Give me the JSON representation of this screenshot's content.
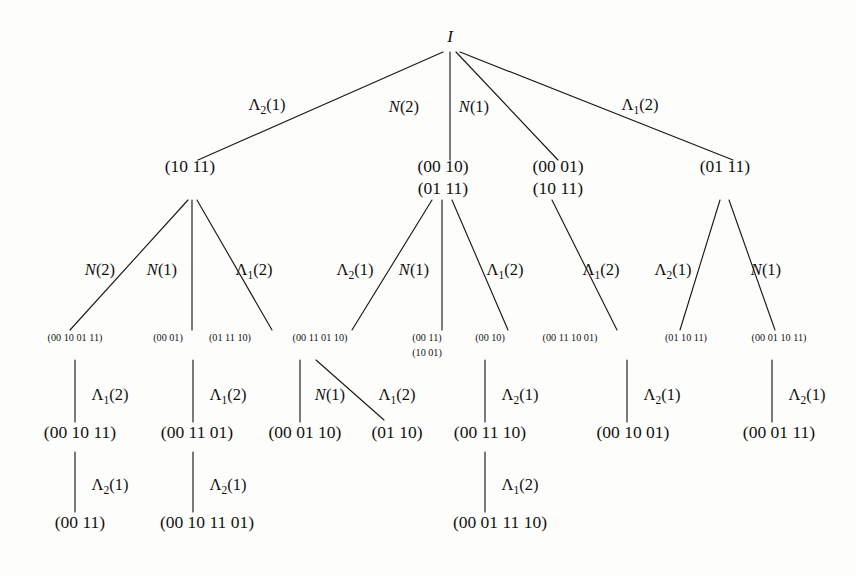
{
  "figure": {
    "type": "derivation-tree",
    "background_color": "#fdfdfc",
    "line_color": "#1a1a1a",
    "text_color": "#111111"
  },
  "nodes": [
    {
      "id": "n0",
      "label": "I",
      "lines": [
        "I"
      ],
      "x": 450,
      "y": 42,
      "size": "root",
      "level": 0
    },
    {
      "id": "n1",
      "label": "(10 11)",
      "lines": [
        "(10 11)"
      ],
      "x": 190,
      "y": 172,
      "size": "big",
      "level": 1
    },
    {
      "id": "n2",
      "label": "(00 10) (01 11)",
      "lines": [
        "(00 10)",
        "(01 11)"
      ],
      "x": 443,
      "y": 172,
      "size": "big",
      "level": 1
    },
    {
      "id": "n3",
      "label": "(00 01) (10 11)",
      "lines": [
        "(00 01)",
        "(10 11)"
      ],
      "x": 558,
      "y": 172,
      "size": "big",
      "level": 1
    },
    {
      "id": "n4",
      "label": "(01 11)",
      "lines": [
        "(01 11)"
      ],
      "x": 725,
      "y": 172,
      "size": "big",
      "level": 1
    },
    {
      "id": "n5",
      "label": "(00 10 01 11)",
      "lines": [
        "(00 10 01 11)"
      ],
      "x": 75,
      "y": 341,
      "size": "small",
      "level": 2
    },
    {
      "id": "n6",
      "label": "(00 01)",
      "lines": [
        "(00 01)"
      ],
      "x": 168,
      "y": 341,
      "size": "small",
      "level": 2
    },
    {
      "id": "n7",
      "label": "(01 11 10)",
      "lines": [
        "(01 11 10)"
      ],
      "x": 230,
      "y": 341,
      "size": "small",
      "level": 2
    },
    {
      "id": "n8",
      "label": "(00 11 01 10)",
      "lines": [
        "(00 11 01 10)"
      ],
      "x": 320,
      "y": 341,
      "size": "small",
      "level": 2
    },
    {
      "id": "n9",
      "label": "(00 11) (10 01)",
      "lines": [
        "(00 11)",
        "(10 01)"
      ],
      "x": 427,
      "y": 341,
      "size": "small",
      "level": 2
    },
    {
      "id": "n10",
      "label": "(00 10)",
      "lines": [
        "(00 10)"
      ],
      "x": 490,
      "y": 341,
      "size": "small",
      "level": 2
    },
    {
      "id": "n11",
      "label": "(00 11 10 01)",
      "lines": [
        "(00 11 10 01)"
      ],
      "x": 570,
      "y": 341,
      "size": "small",
      "level": 2
    },
    {
      "id": "n12",
      "label": "(01 10 11)",
      "lines": [
        "(01 10 11)"
      ],
      "x": 686,
      "y": 341,
      "size": "small",
      "level": 2
    },
    {
      "id": "n13",
      "label": "(00 01 10 11)",
      "lines": [
        "(00 01 10 11)"
      ],
      "x": 779,
      "y": 341,
      "size": "small",
      "level": 2
    },
    {
      "id": "n14",
      "label": "(00 10 11)",
      "lines": [
        "(00 10 11)"
      ],
      "x": 80,
      "y": 438,
      "size": "big",
      "level": 3
    },
    {
      "id": "n15",
      "label": "(00 11 01)",
      "lines": [
        "(00 11 01)"
      ],
      "x": 197,
      "y": 438,
      "size": "big",
      "level": 3
    },
    {
      "id": "n16",
      "label": "(00 01 10)",
      "lines": [
        "(00 01 10)"
      ],
      "x": 305,
      "y": 438,
      "size": "big",
      "level": 3
    },
    {
      "id": "n17",
      "label": "(01 10)",
      "lines": [
        "(01 10)"
      ],
      "x": 397,
      "y": 438,
      "size": "big",
      "level": 3
    },
    {
      "id": "n18",
      "label": "(00 11 10)",
      "lines": [
        "(00 11 10)"
      ],
      "x": 490,
      "y": 438,
      "size": "big",
      "level": 3
    },
    {
      "id": "n19",
      "label": "(00 10 01)",
      "lines": [
        "(00 10 01)"
      ],
      "x": 633,
      "y": 438,
      "size": "big",
      "level": 3
    },
    {
      "id": "n20",
      "label": "(00 01 11)",
      "lines": [
        "(00 01 11)"
      ],
      "x": 779,
      "y": 438,
      "size": "big",
      "level": 3
    },
    {
      "id": "n21",
      "label": "(00 11)",
      "lines": [
        "(00 11)"
      ],
      "x": 80,
      "y": 528,
      "size": "big",
      "level": 4
    },
    {
      "id": "n22",
      "label": "(00 10 11 01)",
      "lines": [
        "(00 10 11 01)"
      ],
      "x": 207,
      "y": 528,
      "size": "big",
      "level": 4
    },
    {
      "id": "n23",
      "label": "(00 01 11 10)",
      "lines": [
        "(00 01 11 10)"
      ],
      "x": 500,
      "y": 528,
      "size": "big",
      "level": 4
    }
  ],
  "edges": [
    {
      "id": "e1",
      "from": "n0",
      "to": "n1",
      "x1": 443,
      "y1": 52,
      "x2": 198,
      "y2": 160,
      "label": "Λ2(1)",
      "op": "Λ",
      "sub": "2",
      "arg": "(1)",
      "lx": 267,
      "ly": 110,
      "size": "normal"
    },
    {
      "id": "e2",
      "from": "n0",
      "to": "n2",
      "x1": 450,
      "y1": 52,
      "x2": 450,
      "y2": 160,
      "label": "N(2)",
      "op": "N",
      "sub": "",
      "arg": "(2)",
      "lx": 404,
      "ly": 112,
      "size": "normal"
    },
    {
      "id": "e3",
      "from": "n0",
      "to": "n3",
      "x1": 456,
      "y1": 52,
      "x2": 558,
      "y2": 160,
      "label": "N(1)",
      "op": "N",
      "sub": "",
      "arg": "(1)",
      "lx": 474,
      "ly": 112,
      "size": "normal"
    },
    {
      "id": "e4",
      "from": "n0",
      "to": "n4",
      "x1": 460,
      "y1": 52,
      "x2": 733,
      "y2": 160,
      "label": "Λ1(2)",
      "op": "Λ",
      "sub": "1",
      "arg": "(2)",
      "lx": 640,
      "ly": 110,
      "size": "normal"
    },
    {
      "id": "e5",
      "from": "n1",
      "to": "n5",
      "x1": 188,
      "y1": 200,
      "x2": 70,
      "y2": 330,
      "label": "N(2)",
      "op": "N",
      "sub": "",
      "arg": "(2)",
      "lx": 100,
      "ly": 275,
      "size": "normal"
    },
    {
      "id": "e6",
      "from": "n1",
      "to": "n6",
      "x1": 192,
      "y1": 200,
      "x2": 192,
      "y2": 330,
      "label": "N(1)",
      "op": "N",
      "sub": "",
      "arg": "(1)",
      "lx": 162,
      "ly": 275,
      "size": "normal"
    },
    {
      "id": "e7",
      "from": "n1",
      "to": "n7",
      "x1": 197,
      "y1": 200,
      "x2": 272,
      "y2": 330,
      "label": "Λ1(2)",
      "op": "Λ",
      "sub": "1",
      "arg": "(2)",
      "lx": 254,
      "ly": 275,
      "size": "normal"
    },
    {
      "id": "e8",
      "from": "n2",
      "to": "n8",
      "x1": 432,
      "y1": 200,
      "x2": 352,
      "y2": 330,
      "label": "Λ2(1)",
      "op": "Λ",
      "sub": "2",
      "arg": "(1)",
      "lx": 355,
      "ly": 275,
      "size": "normal"
    },
    {
      "id": "e9",
      "from": "n2",
      "to": "n9",
      "x1": 442,
      "y1": 200,
      "x2": 442,
      "y2": 330,
      "label": "N(1)",
      "op": "N",
      "sub": "",
      "arg": "(1)",
      "lx": 414,
      "ly": 275,
      "size": "normal"
    },
    {
      "id": "e10",
      "from": "n2",
      "to": "n10",
      "x1": 452,
      "y1": 200,
      "x2": 508,
      "y2": 330,
      "label": "Λ1(2)",
      "op": "Λ",
      "sub": "1",
      "arg": "(2)",
      "lx": 505,
      "ly": 275,
      "size": "normal"
    },
    {
      "id": "e11",
      "from": "n3",
      "to": "n11",
      "x1": 552,
      "y1": 200,
      "x2": 617,
      "y2": 330,
      "label": "Λ1(2)",
      "op": "Λ",
      "sub": "1",
      "arg": "(2)",
      "lx": 601,
      "ly": 275,
      "size": "normal"
    },
    {
      "id": "e12",
      "from": "n4",
      "to": "n12",
      "x1": 720,
      "y1": 200,
      "x2": 680,
      "y2": 330,
      "label": "Λ2(1)",
      "op": "Λ",
      "sub": "2",
      "arg": "(1)",
      "lx": 673,
      "ly": 275,
      "size": "normal"
    },
    {
      "id": "e13",
      "from": "n4",
      "to": "n13",
      "x1": 729,
      "y1": 200,
      "x2": 775,
      "y2": 330,
      "label": "N(1)",
      "op": "N",
      "sub": "",
      "arg": "(1)",
      "lx": 766,
      "ly": 275,
      "size": "normal"
    },
    {
      "id": "e14",
      "from": "n5",
      "to": "n14",
      "x1": 75,
      "y1": 360,
      "x2": 75,
      "y2": 422,
      "label": "Λ1(2)",
      "op": "Λ",
      "sub": "1",
      "arg": "(2)",
      "lx": 110,
      "ly": 400,
      "size": "normal"
    },
    {
      "id": "e15",
      "from": "n7",
      "to": "n15",
      "x1": 193,
      "y1": 360,
      "x2": 193,
      "y2": 422,
      "label": "Λ1(2)",
      "op": "Λ",
      "sub": "1",
      "arg": "(2)",
      "lx": 228,
      "ly": 400,
      "size": "normal"
    },
    {
      "id": "e16",
      "from": "n8",
      "to": "n16",
      "x1": 300,
      "y1": 360,
      "x2": 300,
      "y2": 422,
      "label": "N(1)",
      "op": "N",
      "sub": "",
      "arg": "(1)",
      "lx": 330,
      "ly": 400,
      "size": "normal"
    },
    {
      "id": "e17",
      "from": "n8",
      "to": "n17",
      "x1": 316,
      "y1": 360,
      "x2": 384,
      "y2": 420,
      "label": "Λ1(2)",
      "op": "Λ",
      "sub": "1",
      "arg": "(2)",
      "lx": 397,
      "ly": 400,
      "size": "normal"
    },
    {
      "id": "e18",
      "from": "n10",
      "to": "n18",
      "x1": 485,
      "y1": 360,
      "x2": 485,
      "y2": 422,
      "label": "Λ2(1)",
      "op": "Λ",
      "sub": "2",
      "arg": "(1)",
      "lx": 520,
      "ly": 400,
      "size": "normal"
    },
    {
      "id": "e19",
      "from": "n11",
      "to": "n19",
      "x1": 627,
      "y1": 360,
      "x2": 627,
      "y2": 422,
      "label": "Λ2(1)",
      "op": "Λ",
      "sub": "2",
      "arg": "(1)",
      "lx": 662,
      "ly": 400,
      "size": "normal"
    },
    {
      "id": "e20",
      "from": "n13",
      "to": "n20",
      "x1": 772,
      "y1": 360,
      "x2": 772,
      "y2": 422,
      "label": "Λ2(1)",
      "op": "Λ",
      "sub": "2",
      "arg": "(1)",
      "lx": 807,
      "ly": 400,
      "size": "normal"
    },
    {
      "id": "e21",
      "from": "n14",
      "to": "n21",
      "x1": 75,
      "y1": 452,
      "x2": 75,
      "y2": 512,
      "label": "Λ2(1)",
      "op": "Λ",
      "sub": "2",
      "arg": "(1)",
      "lx": 110,
      "ly": 490,
      "size": "normal"
    },
    {
      "id": "e22",
      "from": "n15",
      "to": "n22",
      "x1": 193,
      "y1": 452,
      "x2": 193,
      "y2": 512,
      "label": "Λ2(1)",
      "op": "Λ",
      "sub": "2",
      "arg": "(1)",
      "lx": 228,
      "ly": 490,
      "size": "normal"
    },
    {
      "id": "e23",
      "from": "n18",
      "to": "n23",
      "x1": 485,
      "y1": 452,
      "x2": 485,
      "y2": 512,
      "label": "Λ1(2)",
      "op": "Λ",
      "sub": "1",
      "arg": "(2)",
      "lx": 520,
      "ly": 490,
      "size": "normal"
    }
  ]
}
